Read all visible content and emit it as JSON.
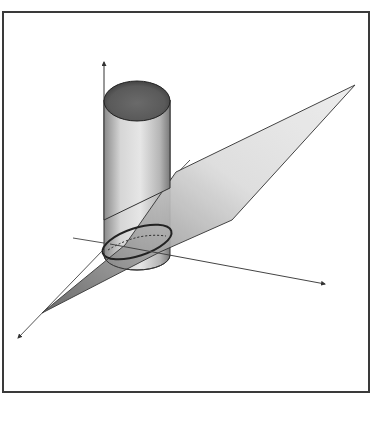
{
  "figure": {
    "colors": {
      "frame": "#3a3a3a",
      "plane_light": "#e4e4e4",
      "plane_dark": "#7a7a7a",
      "cylinder_body": "#d8d8d8",
      "cylinder_top": "#6e6e6e",
      "axis": "#444444",
      "ellipse": "#222222"
    },
    "axes": [
      {
        "name": "z-axis",
        "direction": "vertical-up"
      },
      {
        "name": "x-axis",
        "direction": "right-down"
      },
      {
        "name": "y-axis",
        "direction": "left-down"
      }
    ],
    "shapes": [
      {
        "name": "cylinder",
        "type": "right circular cylinder"
      },
      {
        "name": "plane",
        "type": "tilted cutting plane"
      },
      {
        "name": "intersection",
        "type": "ellipse"
      }
    ]
  }
}
